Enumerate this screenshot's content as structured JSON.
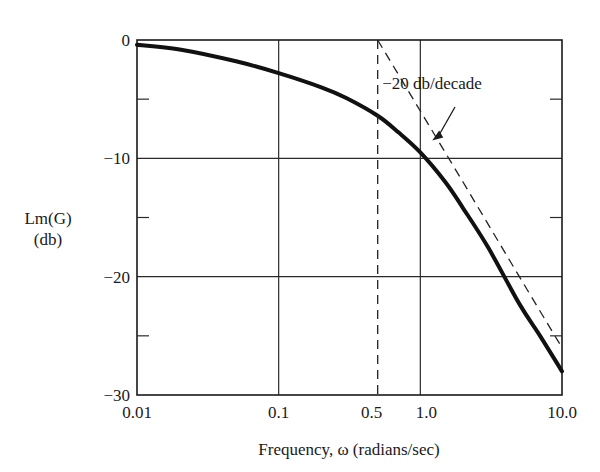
{
  "chart_data": {
    "type": "line",
    "title": "",
    "xlabel": "Frequency, ω (radians/sec)",
    "ylabel": [
      "Lm(G)",
      "(db)"
    ],
    "xscale": "log",
    "xlim": [
      0.01,
      10.0
    ],
    "ylim": [
      -30,
      0
    ],
    "grid": true,
    "x_ticks": [
      {
        "value": 0.01,
        "label": "0.01"
      },
      {
        "value": 0.1,
        "label": "0.1"
      },
      {
        "value": 0.5,
        "label": "0.5"
      },
      {
        "value": 1.0,
        "label": "1.0"
      },
      {
        "value": 10.0,
        "label": "10.0"
      }
    ],
    "y_ticks": [
      {
        "value": 0,
        "label": "0"
      },
      {
        "value": -10,
        "label": "−10"
      },
      {
        "value": -20,
        "label": "−20"
      },
      {
        "value": -30,
        "label": "−30"
      }
    ],
    "y_minor_ticks": [
      -5,
      -15,
      -25
    ],
    "series": [
      {
        "name": "Lm(G) exact curve",
        "style": "solid-thick",
        "x": [
          0.01,
          0.02,
          0.05,
          0.1,
          0.2,
          0.3,
          0.5,
          0.7,
          1.0,
          1.5,
          2.0,
          3.0,
          5.0,
          7.0,
          10.0
        ],
        "y": [
          -0.4,
          -0.8,
          -1.8,
          -2.8,
          -4.0,
          -4.9,
          -6.4,
          -7.8,
          -9.5,
          -12.0,
          -14.2,
          -17.5,
          -22.3,
          -25.0,
          -28.0
        ]
      },
      {
        "name": "Asymptote",
        "style": "dashed",
        "x": [
          0.5,
          1.0,
          2.0,
          5.0,
          10.0
        ],
        "y": [
          0,
          -6.0,
          -12.0,
          -20.0,
          -26.0
        ]
      },
      {
        "name": "Break frequency",
        "style": "dashed-vertical",
        "x": [
          0.5,
          0.5
        ],
        "y": [
          0,
          -30
        ]
      }
    ],
    "annotations": [
      {
        "text": "−20 db/decade",
        "points_to": {
          "x": 1.1,
          "y": -6.8
        }
      }
    ],
    "legend": null
  }
}
